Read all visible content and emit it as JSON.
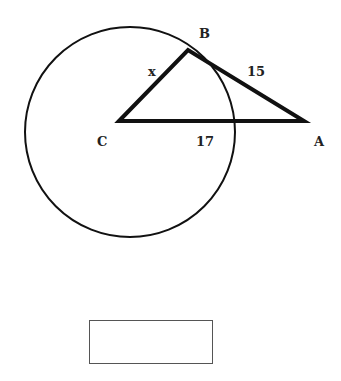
{
  "diagram": {
    "points": {
      "A": {
        "label": "A",
        "x": 304,
        "y": 121
      },
      "B": {
        "label": "B",
        "x": 188,
        "y": 50
      },
      "C": {
        "label": "C",
        "x": 119,
        "y": 121
      }
    },
    "circle": {
      "cx": 130,
      "cy": 132,
      "r": 105
    },
    "segment_labels": {
      "CB": "x",
      "BA": "15",
      "CA": "17"
    },
    "colors": {
      "stroke": "#111111",
      "box_border": "#555555"
    }
  },
  "answer_box": {
    "value": ""
  }
}
